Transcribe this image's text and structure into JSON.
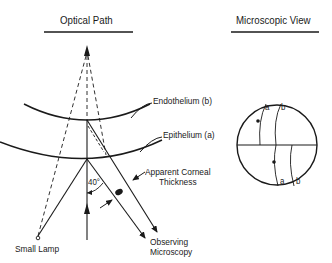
{
  "titles": {
    "optical_path": "Optical Path",
    "microscopic_view": "Microscopic View"
  },
  "labels": {
    "endothelium": "Endothelium (b)",
    "epithelium": "Epithelium (a)",
    "apparent_thickness_line1": "Apparent Corneal",
    "apparent_thickness_line2": "Thickness",
    "angle": "40°",
    "small_lamp": "Small Lamp",
    "observing_line1": "Observing",
    "observing_line2": "Microscopy"
  },
  "microscopic": {
    "upper_a": "a",
    "upper_b": "b",
    "lower_a": "a",
    "lower_b": "b"
  },
  "colors": {
    "stroke": "#1a1a1a",
    "background": "#ffffff"
  }
}
